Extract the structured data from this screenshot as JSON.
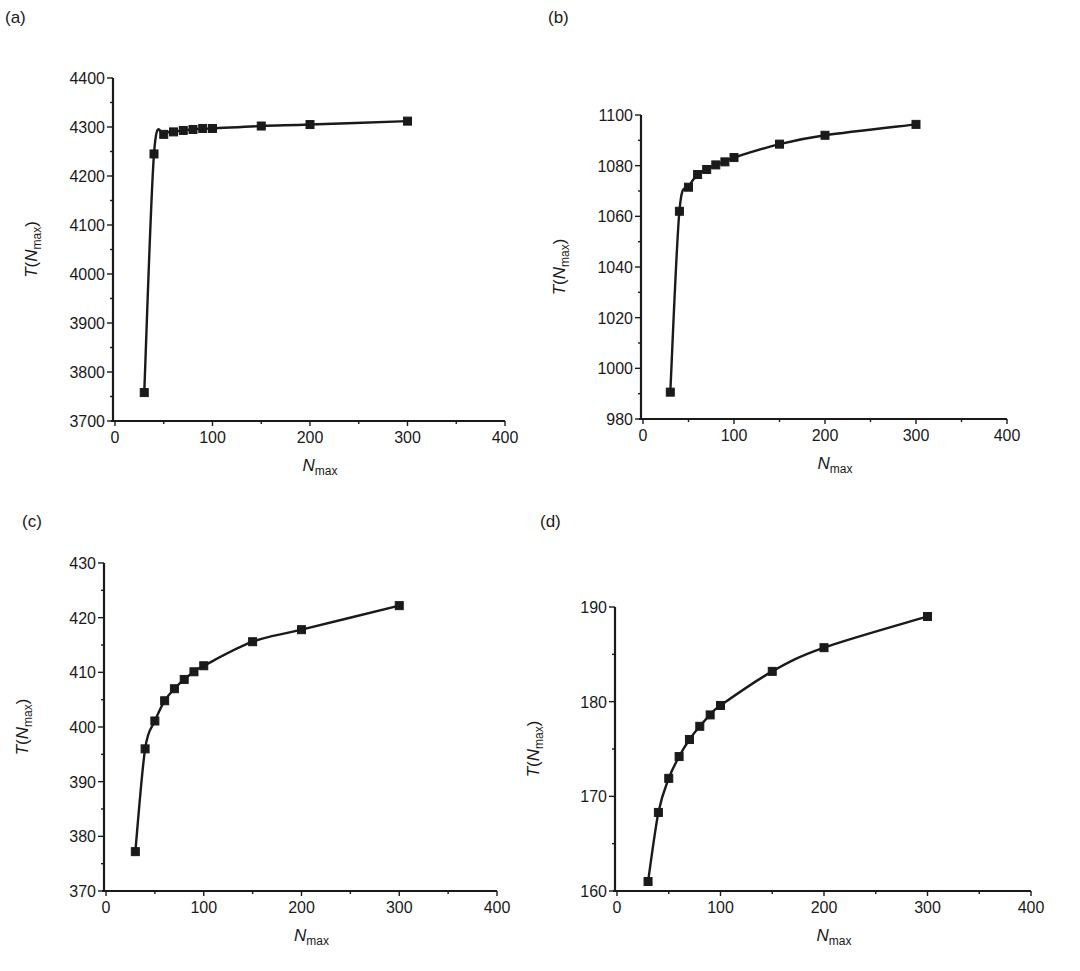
{
  "figure": {
    "panels": [
      {
        "id": "a",
        "label": "(a)"
      },
      {
        "id": "b",
        "label": "(b)"
      },
      {
        "id": "c",
        "label": "(c)"
      },
      {
        "id": "d",
        "label": "(d)"
      }
    ],
    "line_color": "#1a1a1a",
    "marker": "filled-square"
  },
  "chart_data": [
    {
      "panel": "(a)",
      "type": "line",
      "title": "",
      "xlabel": "N_max",
      "ylabel": "T(N_max)",
      "xlim": [
        0,
        400
      ],
      "ylim": [
        3700,
        4400
      ],
      "xticks": [
        0,
        100,
        200,
        300,
        400
      ],
      "yticks": [
        3700,
        3800,
        3900,
        4000,
        4100,
        4200,
        4300,
        4400
      ],
      "grid": false,
      "legend": null,
      "series": [
        {
          "name": "T(N_max)",
          "x": [
            30,
            40,
            50,
            60,
            70,
            80,
            90,
            100,
            150,
            200,
            300
          ],
          "y": [
            3758,
            4245,
            4285,
            4290,
            4293,
            4295,
            4297,
            4297,
            4302,
            4305,
            4312
          ]
        }
      ]
    },
    {
      "panel": "(b)",
      "type": "line",
      "title": "",
      "xlabel": "N_max",
      "ylabel": "T(N_max)",
      "xlim": [
        0,
        400
      ],
      "ylim": [
        980,
        1100
      ],
      "xticks": [
        0,
        100,
        200,
        300,
        400
      ],
      "yticks": [
        980,
        1000,
        1020,
        1040,
        1060,
        1080,
        1100
      ],
      "grid": false,
      "legend": null,
      "series": [
        {
          "name": "T(N_max)",
          "x": [
            30,
            40,
            50,
            60,
            70,
            80,
            90,
            100,
            150,
            200,
            300
          ],
          "y": [
            990.6,
            1062.0,
            1071.5,
            1076.5,
            1078.5,
            1080.3,
            1081.5,
            1083.2,
            1088.5,
            1092.0,
            1096.3
          ]
        }
      ]
    },
    {
      "panel": "(c)",
      "type": "line",
      "title": "",
      "xlabel": "N_max",
      "ylabel": "T(N_max)",
      "xlim": [
        0,
        400
      ],
      "ylim": [
        370,
        430
      ],
      "xticks": [
        0,
        100,
        200,
        300,
        400
      ],
      "yticks": [
        370,
        380,
        390,
        400,
        410,
        420,
        430
      ],
      "grid": false,
      "legend": null,
      "series": [
        {
          "name": "T(N_max)",
          "x": [
            30,
            40,
            50,
            60,
            70,
            80,
            90,
            100,
            150,
            200,
            300
          ],
          "y": [
            377.2,
            396.0,
            401.1,
            404.8,
            407.0,
            408.7,
            410.1,
            411.2,
            415.6,
            417.8,
            422.2
          ]
        }
      ]
    },
    {
      "panel": "(d)",
      "type": "line",
      "title": "",
      "xlabel": "N_max",
      "ylabel": "T(N_max)",
      "xlim": [
        0,
        400
      ],
      "ylim": [
        160,
        190
      ],
      "xticks": [
        0,
        100,
        200,
        300,
        400
      ],
      "yticks": [
        160,
        170,
        180,
        190
      ],
      "grid": false,
      "legend": null,
      "series": [
        {
          "name": "T(N_max)",
          "x": [
            30,
            40,
            50,
            60,
            70,
            80,
            90,
            100,
            150,
            200,
            300
          ],
          "y": [
            161.0,
            168.3,
            171.9,
            174.2,
            176.0,
            177.4,
            178.6,
            179.6,
            183.2,
            185.7,
            189.0
          ]
        }
      ]
    }
  ],
  "layout": [
    {
      "x0": 115,
      "x1": 505,
      "y_top": 78,
      "y_bot": 421,
      "label_x": 5,
      "label_y": 8,
      "minor_y": 50
    },
    {
      "x0": 643,
      "x1": 1007,
      "y_top": 115,
      "y_bot": 419,
      "label_x": 548,
      "label_y": 8,
      "minor_y": 10
    },
    {
      "x0": 106,
      "x1": 497,
      "y_top": 563,
      "y_bot": 891,
      "label_x": 22,
      "label_y": 512,
      "minor_y": 5
    },
    {
      "x0": 617,
      "x1": 1031,
      "y_top": 607,
      "y_bot": 891,
      "label_x": 540,
      "label_y": 512,
      "minor_y": 5
    }
  ]
}
